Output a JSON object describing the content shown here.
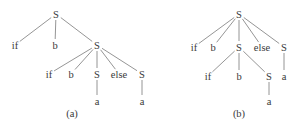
{
  "colors": {
    "background": "#ffffff",
    "edge": "#7a7a7a",
    "text": "#3a3a3a"
  },
  "trees": [
    {
      "id": "a",
      "caption": "(a)",
      "caption_pos": [
        72,
        113
      ],
      "nodes": [
        {
          "id": "n0",
          "label": "S",
          "x": 56,
          "y": 14
        },
        {
          "id": "n1",
          "label": "if",
          "x": 15,
          "y": 45
        },
        {
          "id": "n2",
          "label": "b",
          "x": 55,
          "y": 45
        },
        {
          "id": "n3",
          "label": "S",
          "x": 97,
          "y": 45
        },
        {
          "id": "n4",
          "label": "if",
          "x": 49,
          "y": 74
        },
        {
          "id": "n5",
          "label": "b",
          "x": 71,
          "y": 74
        },
        {
          "id": "n6",
          "label": "S",
          "x": 97,
          "y": 74
        },
        {
          "id": "n7",
          "label": "else",
          "x": 119,
          "y": 74
        },
        {
          "id": "n8",
          "label": "S",
          "x": 142,
          "y": 74
        },
        {
          "id": "n9",
          "label": "a",
          "x": 97,
          "y": 101
        },
        {
          "id": "n10",
          "label": "a",
          "x": 142,
          "y": 101
        }
      ],
      "edges": [
        [
          "n0",
          "n1"
        ],
        [
          "n0",
          "n2"
        ],
        [
          "n0",
          "n3"
        ],
        [
          "n3",
          "n4"
        ],
        [
          "n3",
          "n5"
        ],
        [
          "n3",
          "n6"
        ],
        [
          "n3",
          "n7"
        ],
        [
          "n3",
          "n8"
        ],
        [
          "n6",
          "n9"
        ],
        [
          "n8",
          "n10"
        ]
      ]
    },
    {
      "id": "b",
      "caption": "(b)",
      "caption_pos": [
        239,
        113
      ],
      "nodes": [
        {
          "id": "m0",
          "label": "S",
          "x": 239,
          "y": 14
        },
        {
          "id": "m1",
          "label": "if",
          "x": 194,
          "y": 47
        },
        {
          "id": "m2",
          "label": "b",
          "x": 213,
          "y": 47
        },
        {
          "id": "m3",
          "label": "S",
          "x": 239,
          "y": 47
        },
        {
          "id": "m4",
          "label": "else",
          "x": 262,
          "y": 47
        },
        {
          "id": "m5",
          "label": "S",
          "x": 284,
          "y": 47
        },
        {
          "id": "m6",
          "label": "if",
          "x": 208,
          "y": 76
        },
        {
          "id": "m7",
          "label": "b",
          "x": 239,
          "y": 76
        },
        {
          "id": "m8",
          "label": "S",
          "x": 269,
          "y": 76
        },
        {
          "id": "m9",
          "label": "a",
          "x": 284,
          "y": 76
        },
        {
          "id": "m10",
          "label": "a",
          "x": 269,
          "y": 101
        }
      ],
      "edges": [
        [
          "m0",
          "m1"
        ],
        [
          "m0",
          "m2"
        ],
        [
          "m0",
          "m3"
        ],
        [
          "m0",
          "m4"
        ],
        [
          "m0",
          "m5"
        ],
        [
          "m3",
          "m6"
        ],
        [
          "m3",
          "m7"
        ],
        [
          "m3",
          "m8"
        ],
        [
          "m5",
          "m9"
        ],
        [
          "m8",
          "m10"
        ]
      ]
    }
  ]
}
